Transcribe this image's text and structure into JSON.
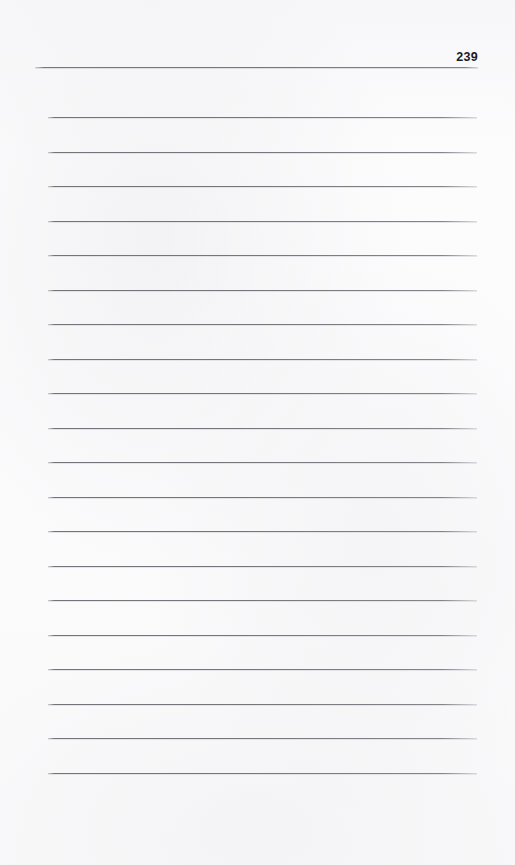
{
  "document": {
    "type": "ruled-notebook-page",
    "page_number": "239",
    "background_color": "#fbfbfc",
    "rule_color": "#6e6e74",
    "header_rule_color": "#68686e",
    "text_color": "#1b1b1f",
    "content": "",
    "header": {
      "folio_label": "239",
      "folio_position": "top-right",
      "rule_present": true
    },
    "body": {
      "line_count": 20,
      "first_line_y": 117,
      "line_spacing": 34.5,
      "line_left": 48,
      "line_right": 477,
      "lines": [
        {
          "index": 1,
          "text": ""
        },
        {
          "index": 2,
          "text": ""
        },
        {
          "index": 3,
          "text": ""
        },
        {
          "index": 4,
          "text": ""
        },
        {
          "index": 5,
          "text": ""
        },
        {
          "index": 6,
          "text": ""
        },
        {
          "index": 7,
          "text": ""
        },
        {
          "index": 8,
          "text": ""
        },
        {
          "index": 9,
          "text": ""
        },
        {
          "index": 10,
          "text": ""
        },
        {
          "index": 11,
          "text": ""
        },
        {
          "index": 12,
          "text": ""
        },
        {
          "index": 13,
          "text": ""
        },
        {
          "index": 14,
          "text": ""
        },
        {
          "index": 15,
          "text": ""
        },
        {
          "index": 16,
          "text": ""
        },
        {
          "index": 17,
          "text": ""
        },
        {
          "index": 18,
          "text": ""
        },
        {
          "index": 19,
          "text": ""
        },
        {
          "index": 20,
          "text": ""
        }
      ]
    }
  }
}
